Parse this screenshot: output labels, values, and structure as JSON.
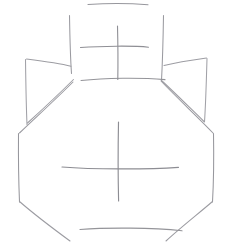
{
  "canvas": {
    "width": 232,
    "height": 242,
    "background_color": "#ffffff",
    "title": "line-drawing-vase-with-handles",
    "description": "Thin grey freehand line sketch of a two-handled jar / amphora with cross marks on the neck and on the body"
  },
  "style": {
    "stroke_color_dark": "#8a8a90",
    "stroke_color_mid": "#9b9ba1",
    "stroke_color_light": "#b4b4ba",
    "stroke_width_main": 1,
    "stroke_width_thin": 0.9
  },
  "drawing": {
    "type": "freehand-line-sketch",
    "subject": "vase",
    "groups": [
      {
        "name": "neck",
        "label": "Neck",
        "strokes": [
          {
            "name": "neck-rim-top",
            "d": "M 88 4.5 C 104 3.4 132 3.4 148 4.8",
            "color": "#97979d",
            "width": 1.1
          },
          {
            "name": "neck-left-edge",
            "d": "M 69.5 15.5 C 69.8 33 70.2 55 71.5 73.5",
            "color": "#9a9aa0",
            "width": 1.05
          },
          {
            "name": "neck-right-edge",
            "d": "M 163.5 15.5 C 163.2 35 162.6 60 161.5 80.5",
            "color": "#9a9aa0",
            "width": 1.05
          },
          {
            "name": "neck-base-line",
            "d": "M 81 80.5 C 105 77.8 140 77.4 165 79.6",
            "color": "#949499",
            "width": 1.1
          }
        ]
      },
      {
        "name": "neck-cross",
        "label": "Cross mark on neck",
        "strokes": [
          {
            "name": "neck-cross-vertical",
            "d": "M 117.5 26 C 117.9 42 118.1 62 117.8 79.5",
            "color": "#8f8f95",
            "width": 1.1
          },
          {
            "name": "neck-cross-horizontal",
            "d": "M 80.5 47.5 C 101 46 134 45.6 148.5 47.2",
            "color": "#8f8f95",
            "width": 1.1
          }
        ]
      },
      {
        "name": "left-handle",
        "label": "Left handle",
        "strokes": [
          {
            "name": "left-handle-top-edge",
            "d": "M 26.5 59 C 42 61 60 63.5 71 66.2",
            "color": "#9d9da3",
            "width": 1.05
          },
          {
            "name": "left-handle-outer-edge",
            "d": "M 25.5 59.5 C 25.8 81 26.1 104 27 124.5",
            "color": "#a1a1a7",
            "width": 1.05
          },
          {
            "name": "left-handle-inner-edge",
            "d": "M 27.5 123 C 44 108 60 93 73.5 79.5",
            "color": "#9d9da3",
            "width": 1.05
          }
        ]
      },
      {
        "name": "right-handle",
        "label": "Right handle",
        "strokes": [
          {
            "name": "right-handle-top-edge",
            "d": "M 206.5 58 C 192 60 176 62.5 164 65.5",
            "color": "#9d9da3",
            "width": 1.05
          },
          {
            "name": "right-handle-outer-edge",
            "d": "M 207 58.5 C 206.4 80 205.8 102 204.5 122",
            "color": "#a1a1a7",
            "width": 1.05
          },
          {
            "name": "right-handle-inner-edge",
            "d": "M 204 121.5 C 188 106 174 92 161.5 80.5",
            "color": "#9d9da3",
            "width": 1.05
          }
        ]
      },
      {
        "name": "body",
        "label": "Jar body outline",
        "strokes": [
          {
            "name": "body-left-shoulder",
            "d": "M 19.5 133 C 34 119 54 101 73 82",
            "color": "#9a9aa0",
            "width": 1.05
          },
          {
            "name": "body-left-side",
            "d": "M 18.5 133.5 C 18.3 156 18.6 181 19.5 202",
            "color": "#97979d",
            "width": 1.05
          },
          {
            "name": "body-left-foot",
            "d": "M 19.5 201.5 C 35 215 55 230 70 241",
            "color": "#9c9ca2",
            "width": 1.05
          },
          {
            "name": "body-right-shoulder",
            "d": "M 213 133 C 199 118 179 100 161 81",
            "color": "#9a9aa0",
            "width": 1.05
          },
          {
            "name": "body-right-side",
            "d": "M 213.5 133.5 C 213.9 156 213.7 181 212.5 202",
            "color": "#97979d",
            "width": 1.05
          },
          {
            "name": "body-right-foot",
            "d": "M 212.5 201.5 C 198 214 180 228 166 241",
            "color": "#9c9ca2",
            "width": 1.05
          },
          {
            "name": "body-base-line",
            "d": "M 80 229.5 C 108 227.4 152 227.6 182 230.8",
            "color": "#949499",
            "width": 1.15
          }
        ]
      },
      {
        "name": "body-cross",
        "label": "Cross mark on body",
        "strokes": [
          {
            "name": "body-cross-vertical",
            "d": "M 118.5 122 C 118.1 143 118.0 176 118.6 201",
            "color": "#8d8d93",
            "width": 1.15
          },
          {
            "name": "body-cross-horizontal",
            "d": "M 62 167 C 92 169.4 146 169.6 178.5 167.4",
            "color": "#8d8d93",
            "width": 1.15
          }
        ]
      }
    ]
  }
}
